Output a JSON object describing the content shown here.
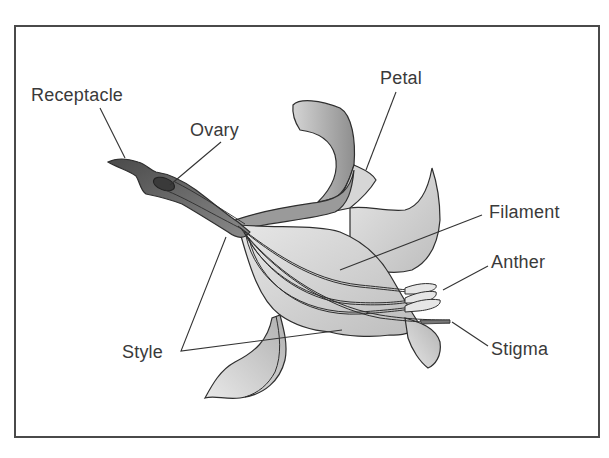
{
  "diagram": {
    "type": "flower-anatomy",
    "labels": {
      "receptacle": "Receptacle",
      "ovary": "Ovary",
      "petal": "Petal",
      "filament": "Filament",
      "anther": "Anther",
      "stigma": "Stigma",
      "style": "Style"
    },
    "colors": {
      "frame": "#4a4a4a",
      "text": "#3a3a3a",
      "receptacle_fill": "#5a5a5a",
      "ovary_fill": "#444444",
      "petal_fill": "#d8d8d8",
      "petal_shade": "#a8a8a8",
      "outline": "#2e2e2e"
    }
  }
}
